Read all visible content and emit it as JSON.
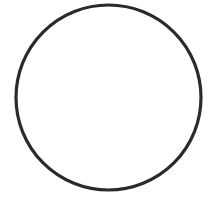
{
  "diagram": {
    "shape": "circle",
    "cx": 108.5,
    "cy": 97.5,
    "r": 92.5,
    "stroke_color": "#2a2a2a",
    "stroke_width": 3.2,
    "fill_color": "#ffffff",
    "background": "#ffffff"
  }
}
